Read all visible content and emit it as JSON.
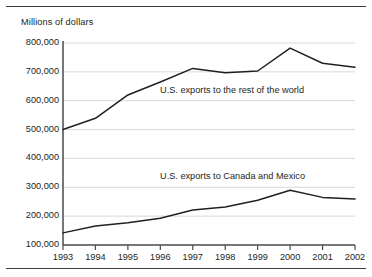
{
  "chart_data": {
    "type": "line",
    "title": "",
    "axis_note": "Millions of dollars",
    "xlabel": "",
    "ylabel": "",
    "categories": [
      "1993",
      "1994",
      "1995",
      "1996",
      "1997",
      "1998",
      "1999",
      "2000",
      "2001",
      "2002"
    ],
    "x": [
      1993,
      1994,
      1995,
      1996,
      1997,
      1998,
      1999,
      2000,
      2001,
      2002
    ],
    "ylim": [
      100000,
      800000
    ],
    "xlim": [
      1993,
      2002
    ],
    "yticks": [
      100000,
      200000,
      300000,
      400000,
      500000,
      600000,
      700000,
      800000
    ],
    "ytick_labels": [
      "100,000",
      "200,000",
      "300,000",
      "400,000",
      "500,000",
      "600,000",
      "700,000",
      "800,000"
    ],
    "grid": true,
    "grid_orientation": "horizontal",
    "legend_position": "inline-annotation",
    "series": [
      {
        "name": "U.S. exports to the rest of the world",
        "color": "#231f20",
        "values": [
          500000,
          539000,
          620000,
          665000,
          712000,
          697000,
          703000,
          782000,
          730000,
          716000
        ]
      },
      {
        "name": "U.S. exports to Canada and Mexico",
        "color": "#231f20",
        "values": [
          142000,
          166000,
          177000,
          193000,
          221000,
          232000,
          255000,
          290000,
          265000,
          259000
        ]
      }
    ],
    "annotations": [
      {
        "text": "U.S. exports to the rest of the world",
        "series": "U.S. exports to the rest of the world"
      },
      {
        "text": "U.S. exports to Canada and Mexico",
        "series": "U.S. exports to Canada and Mexico"
      }
    ]
  }
}
